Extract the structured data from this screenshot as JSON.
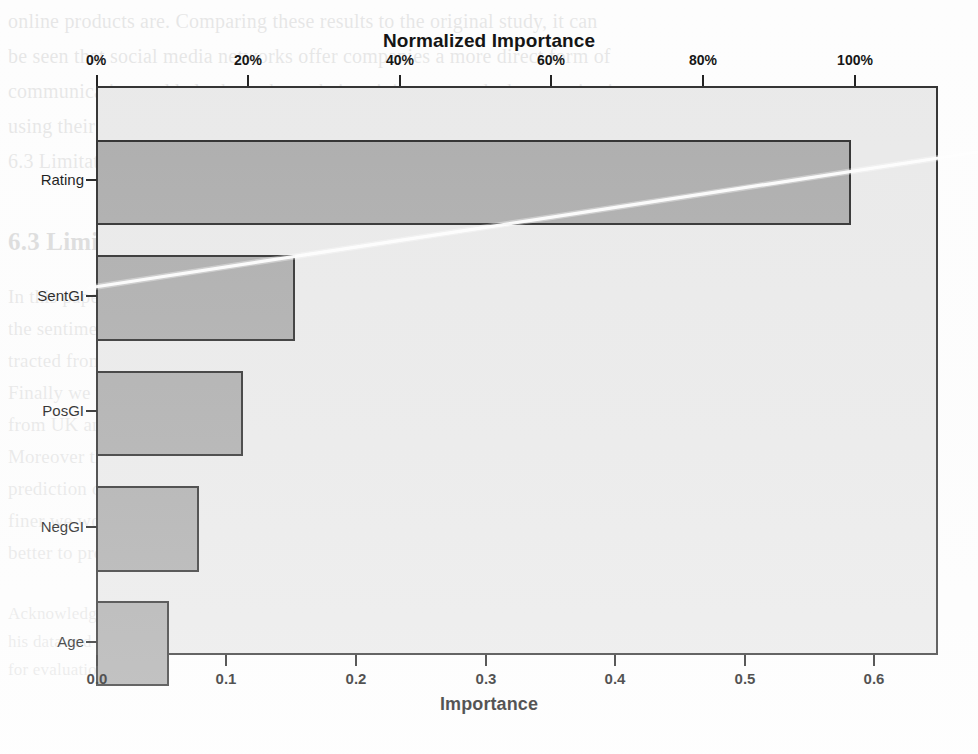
{
  "figure": {
    "title": "Normalized Importance",
    "xlabel": "Importance"
  },
  "chart_data": {
    "type": "bar",
    "orientation": "horizontal",
    "title": "Normalized Importance",
    "xlabel": "Importance",
    "ylabel": "",
    "categories": [
      "Rating",
      "SentGI",
      "PosGI",
      "NegGI",
      "Age"
    ],
    "values": [
      0.586,
      0.154,
      0.114,
      0.08,
      0.057
    ],
    "normalized_values_pct": [
      100.0,
      26.3,
      19.5,
      13.7,
      9.7
    ],
    "xlim": [
      0.0,
      0.65
    ],
    "bottom_axis": {
      "label": "Importance",
      "ticks": [
        0.0,
        0.1,
        0.2,
        0.3,
        0.4,
        0.5,
        0.6
      ],
      "tick_labels": [
        "0.0",
        "0.1",
        "0.2",
        "0.3",
        "0.4",
        "0.5",
        "0.6"
      ]
    },
    "top_axis": {
      "label": "Normalized Importance",
      "ticks": [
        0,
        20,
        40,
        60,
        80,
        100
      ],
      "tick_labels": [
        "0%",
        "20%",
        "40%",
        "60%",
        "80%",
        "100%"
      ]
    },
    "grid": false,
    "legend": null,
    "colors": {
      "bar_fill": "#ababab",
      "bar_border": "#2b2b2b",
      "plot_background": "#e9e9e9",
      "plot_border": "#2e2e2e",
      "text": "#111111"
    }
  },
  "background_text": {
    "lines": [
      "online products are. Comparing these results to the original study, it can",
      "be seen that social media networks offer companies a more direct form of",
      "communication and help them shape their opinions towards the organization",
      "using their online presence.",
      "6.3 Limitations and Future Research",
      "In this paper we used sentiment analysis at an opinion-mining technique to compute",
      "the sentiment scores for the categories, leaving out data from the linear models ex-",
      "tracted from the logistic regression and used them to calculate the overall sentiment.",
      "Finally we measure swiftly computed by the volume of the most powerful predictors",
      "from UK and NS confirm that the overwatching predictor is the most commonly",
      "Moreover the sentiment analysis techniques are very effective, but using the model",
      "prediction of consumer opinions may have particular content limitations, and a more",
      "finer we would like to extend our work at other items and to analyze the trends to",
      "better to produce the scope of our findings.",
      "Acknowledgment. The authors would like to thank Prof. Brooks for his consent on the use of",
      "his data and for providing the necessary resource and his permission to use some of his results",
      "for evaluation."
    ]
  }
}
